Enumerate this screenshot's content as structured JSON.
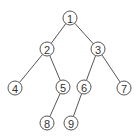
{
  "diagram": {
    "type": "binary-tree",
    "nodes": [
      {
        "id": "1",
        "label": "1",
        "x": 70,
        "y": 18
      },
      {
        "id": "2",
        "label": "2",
        "x": 47,
        "y": 49
      },
      {
        "id": "3",
        "label": "3",
        "x": 98,
        "y": 49
      },
      {
        "id": "4",
        "label": "4",
        "x": 15,
        "y": 88
      },
      {
        "id": "5",
        "label": "5",
        "x": 63,
        "y": 87
      },
      {
        "id": "6",
        "label": "6",
        "x": 84,
        "y": 87
      },
      {
        "id": "7",
        "label": "7",
        "x": 124,
        "y": 88
      },
      {
        "id": "8",
        "label": "8",
        "x": 47,
        "y": 123
      },
      {
        "id": "9",
        "label": "9",
        "x": 71,
        "y": 123
      }
    ],
    "edges": [
      {
        "from": "1",
        "to": "2"
      },
      {
        "from": "1",
        "to": "3"
      },
      {
        "from": "2",
        "to": "4"
      },
      {
        "from": "2",
        "to": "5"
      },
      {
        "from": "3",
        "to": "6"
      },
      {
        "from": "3",
        "to": "7"
      },
      {
        "from": "5",
        "to": "8"
      },
      {
        "from": "6",
        "to": "9"
      }
    ],
    "colors": {
      "stroke": "#555555",
      "text": "#333333",
      "background": "#ffffff"
    }
  }
}
